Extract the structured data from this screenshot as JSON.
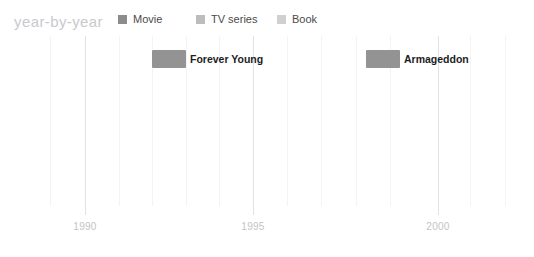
{
  "header": {
    "title": "year-by-year",
    "legend": [
      {
        "label": "Movie",
        "color": "#8c8c8c",
        "x": 118
      },
      {
        "label": "TV series",
        "color": "#bdbdbd",
        "x": 196
      },
      {
        "label": "Book",
        "color": "#d0d0d0",
        "x": 277
      }
    ]
  },
  "chart_data": {
    "type": "bar",
    "orientation": "horizontal-timeline",
    "title": "year-by-year",
    "xlabel": "",
    "ylabel": "",
    "xlim": [
      1988,
      2002
    ],
    "grid": true,
    "legend_position": "top",
    "series": [
      {
        "name": "Movie",
        "color": "#8c8c8c"
      },
      {
        "name": "TV series",
        "color": "#bdbdbd"
      },
      {
        "name": "Book",
        "color": "#d0d0d0"
      }
    ],
    "tick_values": [
      1990,
      1995,
      2000
    ],
    "tick_labels": [
      "1990",
      "1995",
      "2000"
    ],
    "tick_positions_px": [
      85,
      253,
      438
    ],
    "minor_gridlines_px": [
      50,
      119,
      152,
      186,
      219,
      287,
      321,
      356,
      390,
      470,
      505
    ],
    "items": [
      {
        "label": "Forever Young",
        "series": "Movie",
        "color": "#939393",
        "start_year": 1992,
        "end_year": 1993,
        "x_px": 152,
        "width_px": 34,
        "y_px": 14,
        "height_px": 18,
        "label_x_px": 190
      },
      {
        "label": "Armageddon",
        "series": "Movie",
        "color": "#939393",
        "start_year": 1998,
        "end_year": 1999,
        "x_px": 366,
        "width_px": 34,
        "y_px": 14,
        "height_px": 18,
        "label_x_px": 404
      }
    ]
  }
}
